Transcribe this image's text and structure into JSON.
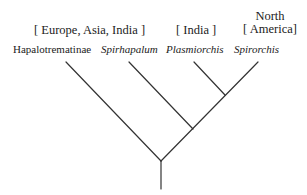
{
  "diagram": {
    "type": "cladogram",
    "regions": [
      {
        "label": "[ Europe, Asia, India ]"
      },
      {
        "label": "[ India ]"
      },
      {
        "label_line1": "North",
        "label_line2": "[ America]"
      }
    ],
    "taxa": [
      {
        "name": "Hapalotrematinae",
        "italic": false
      },
      {
        "name": "Spirhapalum",
        "italic": true
      },
      {
        "name": "Plasmiorchis",
        "italic": true
      },
      {
        "name": "Spirorchis",
        "italic": true
      }
    ],
    "topology": "(Hapalotrematinae,(Spirhapalum,(Plasmiorchis,Spirorchis)))",
    "line_color": "#333333"
  }
}
